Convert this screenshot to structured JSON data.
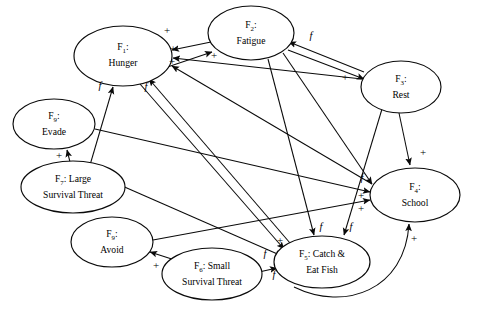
{
  "diagram": {
    "type": "directed-graph",
    "title": "",
    "background_color": "#ffffff",
    "line_color": "#0a0a0a",
    "nodes": [
      {
        "id": "F1",
        "prefix": "F",
        "subscript": "1",
        "suffix": ":",
        "name": "Hunger",
        "label_lines": [
          "F1:",
          "Hunger"
        ],
        "cx": 123,
        "cy": 56,
        "rx": 49,
        "ry": 30
      },
      {
        "id": "F2",
        "prefix": "F",
        "subscript": "2",
        "suffix": ":",
        "name": "Fatigue",
        "label_lines": [
          "F2:",
          "Fatigue"
        ],
        "cx": 251,
        "cy": 33,
        "rx": 43,
        "ry": 27
      },
      {
        "id": "F3",
        "prefix": "F",
        "subscript": "3",
        "suffix": ":",
        "name": "Rest",
        "label_lines": [
          "F3:",
          "Rest"
        ],
        "cx": 401,
        "cy": 87,
        "rx": 40,
        "ry": 26
      },
      {
        "id": "F4",
        "prefix": "F",
        "subscript": "4",
        "suffix": ":",
        "name": "School",
        "label_lines": [
          "F4:",
          "School"
        ],
        "cx": 415,
        "cy": 195,
        "rx": 45,
        "ry": 27
      },
      {
        "id": "F5",
        "prefix": "F",
        "subscript": "5",
        "suffix": ":",
        "name": "Catch & Eat Fish",
        "label_lines": [
          "F5: Catch &",
          "Eat Fish"
        ],
        "cx": 322,
        "cy": 262,
        "rx": 48,
        "ry": 26
      },
      {
        "id": "F6",
        "prefix": "F",
        "subscript": "6",
        "suffix": ":",
        "name": "Small Survival Threat",
        "label_lines": [
          "F6: Small",
          "Survival Threat"
        ],
        "cx": 212,
        "cy": 274,
        "rx": 50,
        "ry": 26
      },
      {
        "id": "F7",
        "prefix": "F",
        "subscript": "7",
        "suffix": ":",
        "name": "Large Survival Threat",
        "label_lines": [
          "F7: Large",
          "Survival Threat"
        ],
        "cx": 73,
        "cy": 187,
        "rx": 52,
        "ry": 26
      },
      {
        "id": "F9_evade",
        "prefix": "F",
        "subscript": "9",
        "suffix": ":",
        "name": "Evade",
        "label_lines": [
          "F9:",
          "Evade"
        ],
        "cx": 54,
        "cy": 124,
        "rx": 41,
        "ry": 25
      },
      {
        "id": "F9_avoid",
        "prefix": "F",
        "subscript": "9",
        "suffix": ":",
        "name": "Avoid",
        "label_lines": [
          "F9:",
          "Avoid"
        ],
        "cx": 112,
        "cy": 242,
        "rx": 41,
        "ry": 25
      }
    ],
    "edges": [
      {
        "from": "F2",
        "to": "F1",
        "label": "+",
        "label_x": 167,
        "label_y": 31
      },
      {
        "from": "F3",
        "to": "F1",
        "label": "+",
        "label_x": 173,
        "label_y": 49
      },
      {
        "from": "F4",
        "to": "F1",
        "label": "+",
        "label_x": 172,
        "label_y": 62
      },
      {
        "from": "F5",
        "to": "F1",
        "label": "f",
        "label_x": 146,
        "label_y": 88
      },
      {
        "from": "F7",
        "to": "F1",
        "label": "f",
        "label_x": 100,
        "label_y": 87
      },
      {
        "from": "F5",
        "to": "F2",
        "label": "+",
        "label_x": 214,
        "label_y": 56
      },
      {
        "from": "F3",
        "to": "F2",
        "label": "f",
        "label_x": 311,
        "label_y": 37
      },
      {
        "from": "F2",
        "to": "F3",
        "label": "+",
        "label_x": 345,
        "label_y": 78
      },
      {
        "from": "F3",
        "to": "F4",
        "label": "+",
        "label_x": 423,
        "label_y": 153
      },
      {
        "from": "F2",
        "to": "F4",
        "label": "f",
        "label_x": 362,
        "label_y": 179
      },
      {
        "from": "F9_evade",
        "to": "F4",
        "label": "+",
        "label_x": 361,
        "label_y": 196
      },
      {
        "from": "F9_avoid",
        "to": "F4",
        "label": "+",
        "label_x": 361,
        "label_y": 209
      },
      {
        "from": "F5",
        "to": "F4",
        "label": "+",
        "label_x": 414,
        "label_y": 239
      },
      {
        "from": "F2",
        "to": "F5",
        "label": "f",
        "label_x": 321,
        "label_y": 228
      },
      {
        "from": "F3",
        "to": "F5",
        "label": "f",
        "label_x": 351,
        "label_y": 228
      },
      {
        "from": "F1",
        "to": "F5",
        "label": "+",
        "label_x": 280,
        "label_y": 241
      },
      {
        "from": "F6",
        "to": "F5",
        "label": "f",
        "label_x": 265,
        "label_y": 255
      },
      {
        "from": "F6",
        "to": "F5",
        "label": "f",
        "label_x": 274,
        "label_y": 276
      },
      {
        "from": "F7",
        "to": "F9_evade",
        "label": "+",
        "label_x": 59,
        "label_y": 156
      },
      {
        "from": "F6",
        "to": "F9_avoid",
        "label": "+",
        "label_x": 156,
        "label_y": 266
      }
    ],
    "edge_label_legend": {
      "excitatory": "+",
      "feedback": "f"
    }
  }
}
